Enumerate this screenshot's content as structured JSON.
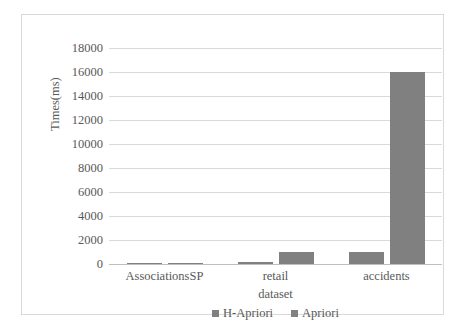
{
  "chart_data": {
    "type": "bar",
    "title": "",
    "subtitle": "",
    "xlabel": "dataset",
    "ylabel": "Times(ms)",
    "categories": [
      "AssociationsSP",
      "retail",
      "accidents"
    ],
    "series": [
      {
        "name": "H-Apriori",
        "values": [
          60,
          150,
          1000
        ],
        "color": "#808080"
      },
      {
        "name": "Apriori",
        "values": [
          80,
          1000,
          16000
        ],
        "color": "#808080"
      }
    ],
    "ylim": [
      0,
      18000
    ],
    "ytick_values": [
      0,
      2000,
      4000,
      6000,
      8000,
      10000,
      12000,
      14000,
      16000,
      18000
    ],
    "ytick_labels": [
      "0",
      "2000",
      "4000",
      "6000",
      "8000",
      "10000",
      "12000",
      "14000",
      "16000",
      "18000"
    ],
    "grid": true,
    "grid_axis": "y",
    "legend_position": "bottom",
    "legend_entries": [
      "H-Apriori",
      "Apriori"
    ],
    "colors": {
      "bar_fill": "#808080",
      "gridline": "#d9d9d9",
      "axis_line": "#bfbfbf",
      "text": "#595959",
      "frame_border": "#d9d9d9",
      "background": "#ffffff"
    }
  }
}
